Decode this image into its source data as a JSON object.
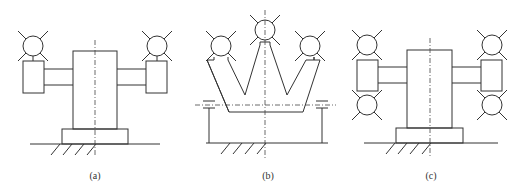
{
  "figures": [
    {
      "id": "a",
      "label": "(a)",
      "description": "Single pedestal column with two side arms, each carrying one tool head (circle with rays) above a housing box"
    },
    {
      "id": "b",
      "label": "(b)",
      "description": "W-shaped multi-arm frame with three tool heads, supported on posts above a ground base"
    },
    {
      "id": "c",
      "label": "(c)",
      "description": "Pedestal column with two side arms, each housing carrying two tool heads (above and below)"
    }
  ],
  "colors": {
    "line": "#333333",
    "background": "#ffffff"
  }
}
